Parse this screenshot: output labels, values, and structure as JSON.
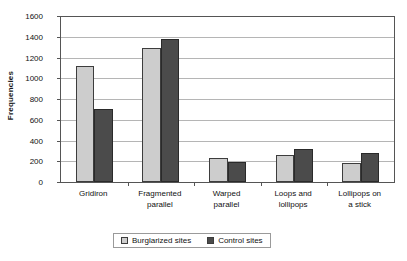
{
  "chart_data": {
    "type": "bar",
    "title": "",
    "xlabel": "",
    "ylabel": "Frequencies",
    "categories": [
      "Gridiron",
      "Fragmented parallel",
      "Warped parallel",
      "Loops and lollipops",
      "Lollipops on a stick"
    ],
    "category_lines": [
      [
        "Gridiron"
      ],
      [
        "Fragmented",
        "parallel"
      ],
      [
        "Warped",
        "parallel"
      ],
      [
        "Loops and",
        "lollipops"
      ],
      [
        "Lollipops on",
        "a stick"
      ]
    ],
    "series": [
      {
        "name": "Burglarized sites",
        "color": "#cdcdcd",
        "values": [
          1120,
          1290,
          228,
          258,
          188
        ]
      },
      {
        "name": "Control sites",
        "color": "#4b4b4b",
        "values": [
          700,
          1380,
          195,
          315,
          275
        ]
      }
    ],
    "ylim": [
      0,
      1600
    ],
    "ytick_step": 200,
    "yticks": [
      0,
      200,
      400,
      600,
      800,
      1000,
      1200,
      1400,
      1600
    ],
    "ytick_labels": [
      "0",
      "200",
      "400",
      "600",
      "800",
      "1000",
      "1200",
      "1400",
      "1600"
    ],
    "grid": true,
    "grid_axis": "y",
    "legend_position": "bottom",
    "legend_entries": [
      "Burglarized sites",
      "Control sites"
    ],
    "colors": {
      "series_burglarized": "#cdcdcd",
      "series_control": "#4b4b4b",
      "axis": "#555555",
      "gridline": "#b5b5b5",
      "text": "#111111",
      "background": "#ffffff"
    }
  }
}
